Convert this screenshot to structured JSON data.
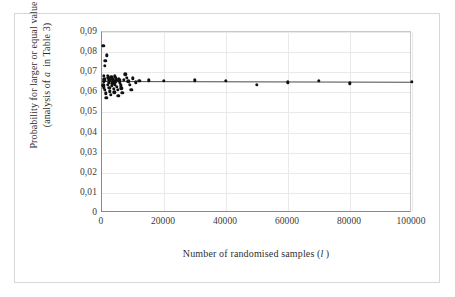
{
  "chart_data": {
    "type": "scatter",
    "title": "",
    "xlabel": "Number of randomised samples (l)",
    "ylabel_line1": "Probability  for larger or equal value",
    "ylabel_line2": "(analysis of a  in Table 3)",
    "xlim": [
      0,
      100000
    ],
    "ylim": [
      0,
      0.09
    ],
    "grid": true,
    "legend": "none",
    "xticks": [
      0,
      20000,
      40000,
      60000,
      80000,
      100000
    ],
    "xtick_labels": [
      "0",
      "20000",
      "40000",
      "60000",
      "80000",
      "100000"
    ],
    "yticks": [
      0,
      0.01,
      0.02,
      0.03,
      0.04,
      0.05,
      0.06,
      0.07,
      0.08,
      0.09
    ],
    "ytick_labels": [
      "0",
      "0,01",
      "0,02",
      "0,03",
      "0,04",
      "0,05",
      "0,06",
      "0,07",
      "0,08",
      "0,09"
    ],
    "reference_line": {
      "y_start": 0.0657,
      "y_end": 0.0653,
      "x_start": 0,
      "x_end": 100000,
      "color": "#4a4a4a"
    },
    "marker_color": "#111111",
    "points": [
      {
        "x": 400,
        "y": 0.0832
      },
      {
        "x": 1500,
        "y": 0.0785
      },
      {
        "x": 1100,
        "y": 0.0757
      },
      {
        "x": 900,
        "y": 0.0732
      },
      {
        "x": 600,
        "y": 0.0681
      },
      {
        "x": 700,
        "y": 0.0668
      },
      {
        "x": 800,
        "y": 0.066
      },
      {
        "x": 500,
        "y": 0.0651
      },
      {
        "x": 450,
        "y": 0.0635
      },
      {
        "x": 650,
        "y": 0.0625
      },
      {
        "x": 1000,
        "y": 0.0613
      },
      {
        "x": 1200,
        "y": 0.0596
      },
      {
        "x": 1400,
        "y": 0.0572
      },
      {
        "x": 1800,
        "y": 0.0682
      },
      {
        "x": 2000,
        "y": 0.0673
      },
      {
        "x": 2200,
        "y": 0.0667
      },
      {
        "x": 2400,
        "y": 0.066
      },
      {
        "x": 2100,
        "y": 0.0648
      },
      {
        "x": 1900,
        "y": 0.0637
      },
      {
        "x": 2300,
        "y": 0.0622
      },
      {
        "x": 2600,
        "y": 0.0605
      },
      {
        "x": 2800,
        "y": 0.0589
      },
      {
        "x": 3000,
        "y": 0.0676
      },
      {
        "x": 3200,
        "y": 0.067
      },
      {
        "x": 3400,
        "y": 0.0664
      },
      {
        "x": 3600,
        "y": 0.0657
      },
      {
        "x": 3300,
        "y": 0.0645
      },
      {
        "x": 3100,
        "y": 0.0631
      },
      {
        "x": 3800,
        "y": 0.0618
      },
      {
        "x": 4000,
        "y": 0.0601
      },
      {
        "x": 4200,
        "y": 0.0679
      },
      {
        "x": 4400,
        "y": 0.0671
      },
      {
        "x": 4600,
        "y": 0.0663
      },
      {
        "x": 4300,
        "y": 0.0652
      },
      {
        "x": 4100,
        "y": 0.064
      },
      {
        "x": 4800,
        "y": 0.0627
      },
      {
        "x": 5000,
        "y": 0.0612
      },
      {
        "x": 5200,
        "y": 0.0583
      },
      {
        "x": 5400,
        "y": 0.0668
      },
      {
        "x": 5600,
        "y": 0.0659
      },
      {
        "x": 5800,
        "y": 0.0646
      },
      {
        "x": 6000,
        "y": 0.0634
      },
      {
        "x": 6200,
        "y": 0.0621
      },
      {
        "x": 6500,
        "y": 0.0598
      },
      {
        "x": 7000,
        "y": 0.0662
      },
      {
        "x": 7500,
        "y": 0.069
      },
      {
        "x": 8000,
        "y": 0.0672
      },
      {
        "x": 8500,
        "y": 0.0655
      },
      {
        "x": 9000,
        "y": 0.0636
      },
      {
        "x": 9500,
        "y": 0.0614
      },
      {
        "x": 10000,
        "y": 0.0669
      },
      {
        "x": 11000,
        "y": 0.065
      },
      {
        "x": 12000,
        "y": 0.0658
      },
      {
        "x": 15000,
        "y": 0.066
      },
      {
        "x": 20000,
        "y": 0.0657
      },
      {
        "x": 30000,
        "y": 0.0659
      },
      {
        "x": 40000,
        "y": 0.0657
      },
      {
        "x": 50000,
        "y": 0.0637
      },
      {
        "x": 60000,
        "y": 0.065
      },
      {
        "x": 70000,
        "y": 0.0657
      },
      {
        "x": 80000,
        "y": 0.0645
      },
      {
        "x": 100000,
        "y": 0.0653
      }
    ]
  }
}
